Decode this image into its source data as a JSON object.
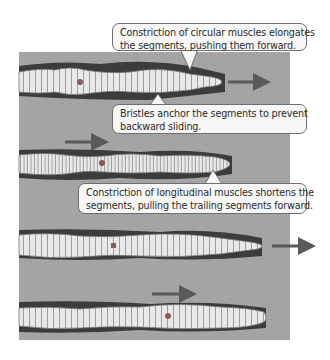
{
  "figure": {
    "background_color": "#a3a3a3",
    "worm_color": "#e6e6e6",
    "burrow_color": "#3c3c3c",
    "arrow_color": "#5a5a5a",
    "clitellum_dot_color": "#8a5a5a"
  },
  "callouts": [
    {
      "id": "circular-muscles",
      "lines": [
        "Constriction of circular muscles elongates",
        "the segments, pushing them forward."
      ]
    },
    {
      "id": "bristles",
      "lines": [
        "Bristles anchor the segments to prevent",
        "backward sliding."
      ]
    },
    {
      "id": "longitudinal-muscles",
      "lines": [
        "Constriction of longitudinal muscles shortens the",
        "segments, pulling the trailing segments forward."
      ]
    }
  ],
  "worms": [
    {
      "stage": 1,
      "arrow": "head-forward"
    },
    {
      "stage": 2,
      "arrow": "tail-forward"
    },
    {
      "stage": 3,
      "arrow": "head-forward"
    },
    {
      "stage": 4,
      "arrow": "mid-forward"
    }
  ],
  "caption": {
    "text": ""
  }
}
